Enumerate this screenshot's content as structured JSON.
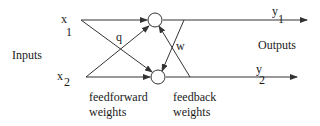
{
  "diagram": {
    "type": "neural-network",
    "labels": {
      "inputs": "Inputs",
      "outputs": "Outputs",
      "x1_var": "x",
      "x1_sub": "1",
      "x2_var": "x",
      "x2_sub": "2",
      "y1_var": "y",
      "y1_sub": "1",
      "y2_var": "y",
      "y2_sub": "2",
      "q": "q",
      "w": "w",
      "feedforward_line1": "feedforward",
      "feedforward_line2": "weights",
      "feedback_line1": "feedback",
      "feedback_line2": "weights"
    },
    "nodes": [
      {
        "id": "n1",
        "role": "output-unit-1"
      },
      {
        "id": "n2",
        "role": "output-unit-2"
      }
    ],
    "edges": [
      {
        "from": "x1",
        "to": "n1",
        "kind": "feedforward"
      },
      {
        "from": "x1",
        "to": "n2",
        "kind": "feedforward",
        "label": "q"
      },
      {
        "from": "x2",
        "to": "n1",
        "kind": "feedforward"
      },
      {
        "from": "x2",
        "to": "n2",
        "kind": "feedforward"
      },
      {
        "from": "n1",
        "to": "y1",
        "kind": "output"
      },
      {
        "from": "n2",
        "to": "y2",
        "kind": "output"
      },
      {
        "from": "y1",
        "to": "n2",
        "kind": "feedback",
        "label": "w"
      },
      {
        "from": "y2",
        "to": "n1",
        "kind": "feedback"
      }
    ]
  }
}
